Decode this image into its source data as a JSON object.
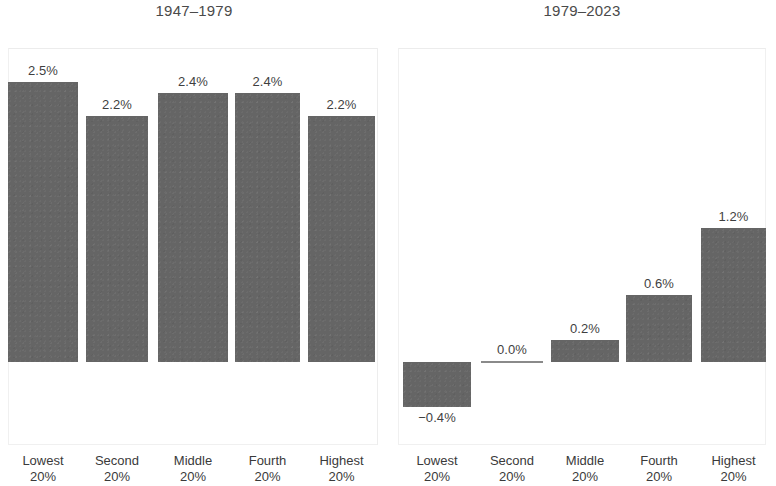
{
  "figure": {
    "background_color": "#ffffff",
    "bar_color": "#656565",
    "text_color": "#3a3a3a"
  },
  "panels": [
    {
      "id": "panel-left",
      "title": "1947–1979",
      "categories": [
        "Lowest\n20%",
        "Second\n20%",
        "Middle\n20%",
        "Fourth\n20%",
        "Highest\n20%"
      ],
      "category_lines": [
        {
          "line1": "Lowest",
          "line2": "20%"
        },
        {
          "line1": "Second",
          "line2": "20%"
        },
        {
          "line1": "Middle",
          "line2": "20%"
        },
        {
          "line1": "Fourth",
          "line2": "20%"
        },
        {
          "line1": "Highest",
          "line2": "20%"
        }
      ],
      "values": [
        2.5,
        2.2,
        2.4,
        2.4,
        2.2
      ],
      "value_labels": [
        "2.5%",
        "2.2%",
        "2.4%",
        "2.4%",
        "2.2%"
      ]
    },
    {
      "id": "panel-right",
      "title": "1979–2023",
      "categories": [
        "Lowest\n20%",
        "Second\n20%",
        "Middle\n20%",
        "Fourth\n20%",
        "Highest\n20%"
      ],
      "category_lines": [
        {
          "line1": "Lowest",
          "line2": "20%"
        },
        {
          "line1": "Second",
          "line2": "20%"
        },
        {
          "line1": "Middle",
          "line2": "20%"
        },
        {
          "line1": "Fourth",
          "line2": "20%"
        },
        {
          "line1": "Highest",
          "line2": "20%"
        }
      ],
      "values": [
        -0.4,
        0.0,
        0.2,
        0.6,
        1.2
      ],
      "value_labels": [
        "−0.4%",
        "0.0%",
        "0.2%",
        "0.6%",
        "1.2%"
      ]
    }
  ],
  "chart_data": {
    "type": "bar",
    "title": "",
    "subtitle": "",
    "xlabel": "",
    "ylabel": "",
    "ylim": [
      -0.6,
      2.75
    ],
    "grid": false,
    "legend_position": "none",
    "panel_layout": "two side-by-side panels sharing a common y-scale",
    "categories": [
      "Lowest 20%",
      "Second 20%",
      "Middle 20%",
      "Fourth 20%",
      "Highest 20%"
    ],
    "series": [
      {
        "name": "1947–1979",
        "values": [
          2.5,
          2.2,
          2.4,
          2.4,
          2.2
        ],
        "data_labels": [
          "2.5%",
          "2.2%",
          "2.4%",
          "2.4%",
          "2.2%"
        ],
        "units": "percent average annual income growth"
      },
      {
        "name": "1979–2023",
        "values": [
          -0.4,
          0.0,
          0.2,
          0.6,
          1.2
        ],
        "data_labels": [
          "−0.4%",
          "0.0%",
          "0.2%",
          "0.6%",
          "1.2%"
        ],
        "units": "percent average annual income growth"
      }
    ],
    "annotations": [
      "Left panel bars are roughly equal across all quintiles (2.2%–2.5%).",
      "Right panel bars rise monotonically from −0.4% to 1.2% across quintiles."
    ]
  }
}
